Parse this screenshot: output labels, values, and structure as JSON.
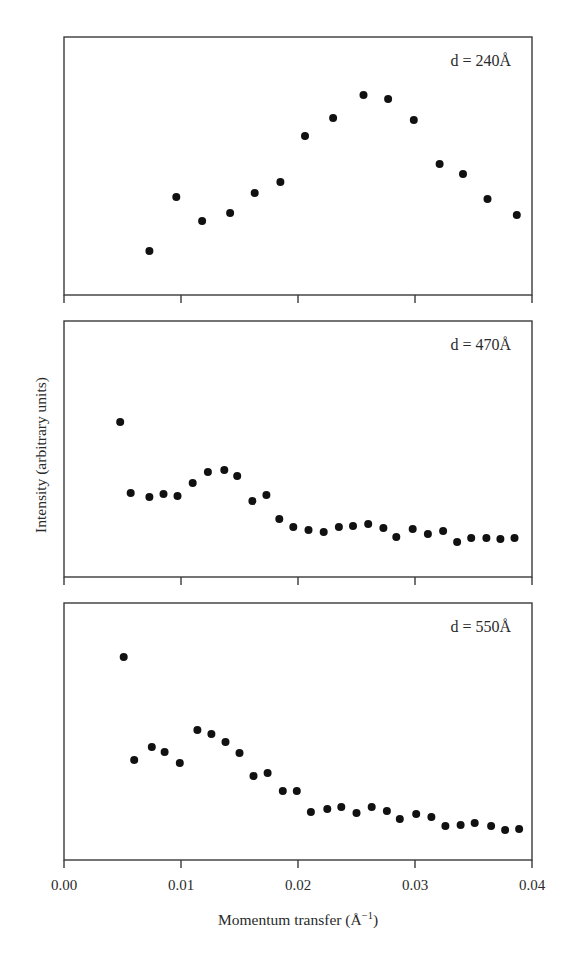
{
  "figure": {
    "ylabel": "Intensity (arbitrary units)",
    "xlabel": "Momentum transfer (Å",
    "xlabel_sup": "−1",
    "xlabel_close": ")",
    "xticks": [
      "0.00",
      "0.01",
      "0.02",
      "0.03",
      "0.04"
    ],
    "panels": [
      {
        "label": "d = 240Å"
      },
      {
        "label": "d = 470Å"
      },
      {
        "label": "d = 550Å"
      }
    ]
  },
  "chart_data": [
    {
      "type": "scatter",
      "title": "d = 240Å",
      "xlabel": "",
      "ylabel": "Intensity (arbitrary units)",
      "xlim": [
        0.0,
        0.04
      ],
      "ylim": [
        0,
        100
      ],
      "xticks": [
        0.0,
        0.01,
        0.02,
        0.03,
        0.04
      ],
      "xtick_labels_shown": false,
      "yticks": [],
      "grid": false,
      "legend": null,
      "annotation": "d = 240Å",
      "x": [
        0.0073,
        0.0096,
        0.0118,
        0.0142,
        0.0163,
        0.0185,
        0.0206,
        0.023,
        0.0256,
        0.0277,
        0.0299,
        0.0321,
        0.0341,
        0.0362,
        0.0387
      ],
      "y": [
        17.1,
        38.0,
        28.7,
        31.8,
        39.5,
        43.8,
        61.6,
        68.6,
        77.5,
        76.0,
        67.8,
        50.8,
        46.9,
        37.2,
        31.0
      ]
    },
    {
      "type": "scatter",
      "title": "d = 470Å",
      "xlabel": "",
      "ylabel": "Intensity (arbitrary units)",
      "xlim": [
        0.0,
        0.04
      ],
      "ylim": [
        0,
        100
      ],
      "xticks": [
        0.0,
        0.01,
        0.02,
        0.03,
        0.04
      ],
      "xtick_labels_shown": false,
      "yticks": [],
      "grid": false,
      "legend": null,
      "annotation": "d = 470Å",
      "x": [
        0.0048,
        0.0057,
        0.0073,
        0.0085,
        0.0097,
        0.011,
        0.0123,
        0.0137,
        0.0148,
        0.0161,
        0.0173,
        0.0184,
        0.0196,
        0.0209,
        0.0222,
        0.0235,
        0.0247,
        0.026,
        0.0273,
        0.0284,
        0.0298,
        0.0311,
        0.0324,
        0.0336,
        0.0348,
        0.0361,
        0.0373,
        0.0385
      ],
      "y": [
        60.5,
        32.8,
        31.3,
        32.4,
        31.6,
        36.7,
        41.0,
        41.8,
        39.5,
        29.7,
        32.0,
        22.7,
        19.5,
        18.4,
        17.6,
        19.5,
        19.9,
        20.7,
        19.1,
        15.6,
        18.8,
        16.8,
        18.0,
        13.7,
        15.2,
        15.2,
        14.8,
        15.2
      ]
    },
    {
      "type": "scatter",
      "title": "d = 550Å",
      "xlabel": "Momentum transfer (Å⁻¹)",
      "ylabel": "Intensity (arbitrary units)",
      "xlim": [
        0.0,
        0.04
      ],
      "ylim": [
        0,
        100
      ],
      "xticks": [
        0.0,
        0.01,
        0.02,
        0.03,
        0.04
      ],
      "xtick_labels": [
        "0.00",
        "0.01",
        "0.02",
        "0.03",
        "0.04"
      ],
      "xtick_labels_shown": true,
      "yticks": [],
      "grid": false,
      "legend": null,
      "annotation": "d = 550Å",
      "x": [
        0.0051,
        0.006,
        0.0075,
        0.0086,
        0.0099,
        0.0114,
        0.0126,
        0.0138,
        0.015,
        0.0162,
        0.0174,
        0.0187,
        0.0199,
        0.0211,
        0.0225,
        0.0237,
        0.025,
        0.0263,
        0.0276,
        0.0287,
        0.0301,
        0.0314,
        0.0326,
        0.0339,
        0.0351,
        0.0365,
        0.0377,
        0.0389
      ],
      "y": [
        79.0,
        38.9,
        44.0,
        42.0,
        37.7,
        50.6,
        49.0,
        45.9,
        41.6,
        32.7,
        33.9,
        26.8,
        26.8,
        18.7,
        19.8,
        20.6,
        18.3,
        20.6,
        19.1,
        16.0,
        17.9,
        16.7,
        13.2,
        13.6,
        14.4,
        13.2,
        11.7,
        12.1
      ]
    }
  ]
}
